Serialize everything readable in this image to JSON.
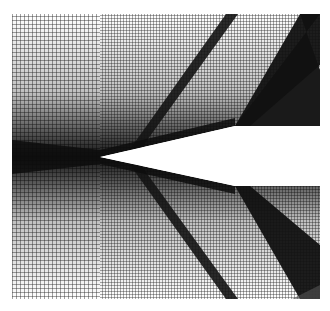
{
  "figure": {
    "type": "computational-mesh",
    "background": "#ffffff",
    "mesh_color": "#3a3a3a",
    "dense_color": "#111111",
    "bounds": {
      "x0": 12,
      "y0": 14,
      "x1": 320,
      "y1": 299
    },
    "wedge_tip": {
      "x": 100,
      "y": 157
    },
    "notch": {
      "x": 235,
      "y_top": 126,
      "y_bottom": 186
    },
    "block_split_x": 100
  }
}
